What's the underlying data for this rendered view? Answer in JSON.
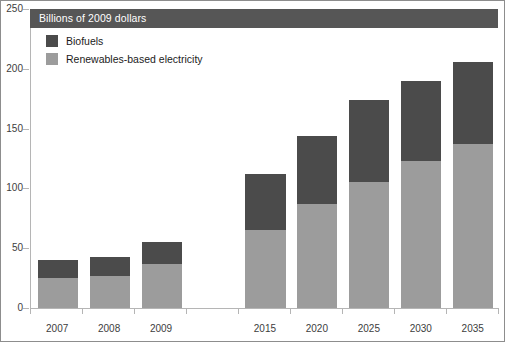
{
  "title": "Billions of 2009 dollars",
  "legend": {
    "position": "top-left-inside",
    "items": [
      {
        "label": "Biofuels",
        "color": "#4b4b4b",
        "key": "biofuels"
      },
      {
        "label": "Renewables-based electricity",
        "color": "#9c9c9c",
        "key": "renewables"
      }
    ]
  },
  "colors": {
    "biofuels": "#4b4b4b",
    "renewables": "#9c9c9c",
    "title_band": "#565656",
    "title_text": "#ffffff",
    "axis": "#b5b5b5",
    "tick_text": "#3d3d3d",
    "border": "#8d8d8d",
    "background": "#ffffff"
  },
  "chart_data": {
    "type": "bar",
    "subtype": "stacked",
    "title": "Billions of 2009 dollars",
    "xlabel": "",
    "ylabel": "Billions of 2009 dollars",
    "ylim": [
      0,
      250
    ],
    "yticks": [
      0,
      50,
      100,
      150,
      200,
      250
    ],
    "ytick_labels": [
      "0",
      "50",
      "100",
      "150",
      "200",
      "250"
    ],
    "grid": false,
    "categories": [
      "2007",
      "2008",
      "2009",
      "2015",
      "2020",
      "2025",
      "2030",
      "2035"
    ],
    "category_gap_after": "2009",
    "series": [
      {
        "name": "Renewables-based electricity",
        "color": "#9c9c9c",
        "values": [
          25,
          27,
          37,
          65,
          87,
          105,
          123,
          137
        ]
      },
      {
        "name": "Biofuels",
        "color": "#4b4b4b",
        "values": [
          15,
          16,
          18,
          47,
          57,
          69,
          67,
          69
        ]
      }
    ],
    "totals": [
      40,
      43,
      55,
      112,
      144,
      174,
      190,
      206
    ]
  },
  "bar_layout": {
    "bars": [
      {
        "category": "2007",
        "left_pct": 1.5,
        "width_pct": 8.6
      },
      {
        "category": "2008",
        "left_pct": 12.6,
        "width_pct": 8.6
      },
      {
        "category": "2009",
        "left_pct": 23.7,
        "width_pct": 8.6
      },
      {
        "category": "2015",
        "left_pct": 45.9,
        "width_pct": 8.6
      },
      {
        "category": "2020",
        "left_pct": 57.0,
        "width_pct": 8.6
      },
      {
        "category": "2025",
        "left_pct": 68.1,
        "width_pct": 8.6
      },
      {
        "category": "2030",
        "left_pct": 79.2,
        "width_pct": 8.6
      },
      {
        "category": "2035",
        "left_pct": 90.3,
        "width_pct": 8.6
      }
    ]
  },
  "x_tick_positions_pct": [
    0.0,
    11.1,
    22.2,
    33.3,
    44.4,
    55.5,
    66.6,
    77.7,
    88.8,
    100.0
  ],
  "x_label_positions_pct": [
    5.8,
    16.9,
    28.0,
    50.2,
    61.3,
    72.4,
    83.5,
    94.6
  ]
}
